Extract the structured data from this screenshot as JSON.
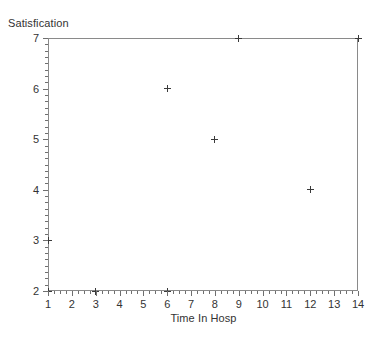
{
  "chart_data": {
    "type": "scatter",
    "title": "",
    "subtitle": "",
    "xlabel": "Time In Hosp",
    "ylabel": "Satisfication",
    "xlim": [
      1,
      14
    ],
    "ylim": [
      2,
      7
    ],
    "xticks": [
      1,
      2,
      3,
      4,
      5,
      6,
      7,
      8,
      9,
      10,
      11,
      12,
      13,
      14
    ],
    "yticks": [
      2,
      3,
      4,
      5,
      6,
      7
    ],
    "xtick_labels": [
      "1",
      "2",
      "3",
      "4",
      "5",
      "6",
      "7",
      "8",
      "9",
      "10",
      "11",
      "12",
      "13",
      "14"
    ],
    "ytick_labels": [
      "2",
      "3",
      "4",
      "5",
      "6",
      "7"
    ],
    "x_minor_step": 0.25,
    "y_minor_step": 0.125,
    "grid": false,
    "legend": null,
    "legend_position": "none",
    "marker": "plus",
    "marker_color": "#3a3a3a",
    "frame_color": "#8a8a8a",
    "background": "#ffffff",
    "points": [
      {
        "x": 1,
        "y": 2
      },
      {
        "x": 1,
        "y": 3
      },
      {
        "x": 3,
        "y": 2
      },
      {
        "x": 6,
        "y": 2
      },
      {
        "x": 6,
        "y": 6
      },
      {
        "x": 8,
        "y": 5
      },
      {
        "x": 9,
        "y": 7
      },
      {
        "x": 12,
        "y": 4
      },
      {
        "x": 14,
        "y": 7
      }
    ],
    "series": [
      {
        "name": "Satisfication vs Time In Hosp",
        "x": [
          1,
          1,
          3,
          6,
          6,
          8,
          9,
          12,
          14
        ],
        "values": [
          2,
          3,
          2,
          2,
          6,
          5,
          7,
          4,
          7
        ]
      }
    ]
  }
}
